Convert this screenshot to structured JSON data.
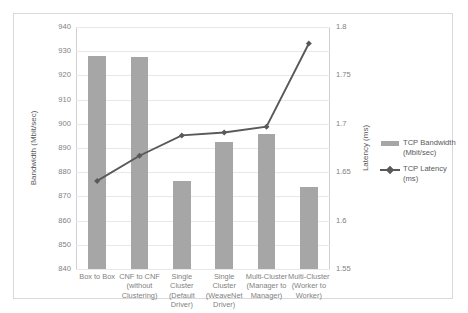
{
  "chart_data": {
    "type": "bar",
    "title": "",
    "categories": [
      "Box to Box",
      "CNF to CNF\n(without\nClustering)",
      "Single\nCluster\n(Default\nDriver)",
      "Single\nCluster\n(WeaveNet\nDriver)",
      "Multi-Cluster\n(Manager to\nManager)",
      "Multi-Cluster\n(Worker to\nWorker)"
    ],
    "series": [
      {
        "name": "TCP Bandwidth (Mbit/sec)",
        "type": "bar",
        "axis": "left",
        "color": "#a6a6a6",
        "values": [
          928.2,
          927.5,
          876.3,
          892.3,
          895.8,
          874.0
        ]
      },
      {
        "name": "TCP Latency (ms)",
        "type": "line",
        "axis": "right",
        "color": "#595959",
        "values": [
          1.641,
          1.667,
          1.688,
          1.691,
          1.697,
          1.783
        ]
      }
    ],
    "xlabel": "",
    "ylabel": "Bandwidth (Mbit/sec)",
    "y2label": "Latency (ms)",
    "ylim": [
      840,
      940
    ],
    "ytick_step": 10,
    "yticks": [
      940,
      930,
      920,
      910,
      900,
      890,
      880,
      870,
      860,
      850,
      840
    ],
    "y2lim": [
      1.55,
      1.8
    ],
    "y2tick_step": 0.05,
    "y2ticks": [
      "1.8",
      "1.75",
      "1.7",
      "1.65",
      "1.6",
      "1.55"
    ],
    "grid": true,
    "legend_position": "right",
    "legend": [
      {
        "label": "TCP Bandwidth\n(Mbit/sec)",
        "marker": "swatch",
        "color": "#a6a6a6"
      },
      {
        "label": "TCP Latency\n(ms)",
        "marker": "line-diamond",
        "color": "#595959"
      }
    ]
  },
  "axes": {
    "left_title": "Bandwidth (Mbit/sec)",
    "right_title": "Latency (ms)"
  }
}
